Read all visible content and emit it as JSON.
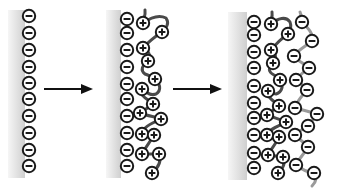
{
  "diagram": {
    "colors": {
      "background": "#ffffff",
      "ion_stroke": "#1a1a1a",
      "polycation_chain": "#4a4a4a",
      "polyanion_chain": "#9a9a9a",
      "surface_light": "#f4f4f4",
      "surface_dark": "#d2d2d2"
    },
    "symbols": {
      "minus": "−",
      "plus": "+"
    },
    "panels": [
      {
        "label": "bare-surface",
        "surface": {
          "x": 8,
          "y": 10,
          "w": 17,
          "h": 168
        },
        "surface_charges": [
          [
            29,
            16
          ],
          [
            29,
            33
          ],
          [
            29,
            50
          ],
          [
            29,
            67
          ],
          [
            29,
            83
          ],
          [
            29,
            99
          ],
          [
            29,
            116
          ],
          [
            29,
            133
          ],
          [
            29,
            150
          ],
          [
            29,
            166
          ]
        ]
      },
      {
        "label": "polycation-layer",
        "surface": {
          "x": 106,
          "y": 10,
          "w": 15,
          "h": 168
        },
        "surface_charges": [
          [
            127,
            19
          ],
          [
            127,
            33
          ],
          [
            127,
            50
          ],
          [
            127,
            67
          ],
          [
            127,
            84
          ],
          [
            127,
            99
          ],
          [
            127,
            116
          ],
          [
            127,
            133
          ],
          [
            127,
            150
          ],
          [
            127,
            166
          ]
        ],
        "polycation_charges": [
          [
            143,
            23
          ],
          [
            162,
            32
          ],
          [
            143,
            48
          ],
          [
            148,
            61
          ],
          [
            155,
            79
          ],
          [
            142,
            89
          ],
          [
            153,
            104
          ],
          [
            140,
            113
          ],
          [
            161,
            119
          ],
          [
            142,
            134
          ],
          [
            154,
            135
          ],
          [
            142,
            154
          ],
          [
            159,
            154
          ],
          [
            152,
            173
          ]
        ]
      },
      {
        "label": "polyanion-layer",
        "surface": {
          "x": 228,
          "y": 12,
          "w": 19,
          "h": 168
        },
        "surface_charges": [
          [
            254,
            22
          ],
          [
            254,
            35
          ],
          [
            254,
            52
          ],
          [
            254,
            68
          ],
          [
            254,
            86
          ],
          [
            254,
            103
          ],
          [
            254,
            118
          ],
          [
            254,
            135
          ],
          [
            254,
            153
          ],
          [
            254,
            168
          ]
        ],
        "polycation_charges": [
          [
            271,
            24
          ],
          [
            288,
            34
          ],
          [
            271,
            50
          ],
          [
            273,
            63
          ],
          [
            280,
            80
          ],
          [
            268,
            91
          ],
          [
            279,
            106
          ],
          [
            267,
            115
          ],
          [
            286,
            122
          ],
          [
            267,
            135
          ],
          [
            279,
            137
          ],
          [
            268,
            155
          ],
          [
            283,
            157
          ],
          [
            278,
            173
          ]
        ],
        "polyanion_charges": [
          [
            302,
            22
          ],
          [
            312,
            41
          ],
          [
            294,
            56
          ],
          [
            309,
            68
          ],
          [
            296,
            80
          ],
          [
            307,
            90
          ],
          [
            295,
            108
          ],
          [
            317,
            114
          ],
          [
            308,
            126
          ],
          [
            295,
            135
          ],
          [
            308,
            147
          ],
          [
            296,
            165
          ],
          [
            314,
            173
          ]
        ]
      }
    ],
    "arrows": [
      {
        "label": "adsorb-polycation",
        "x1": 44,
        "x2": 93,
        "y": 89
      },
      {
        "label": "adsorb-polyanion",
        "x1": 173,
        "x2": 222,
        "y": 89
      }
    ]
  }
}
